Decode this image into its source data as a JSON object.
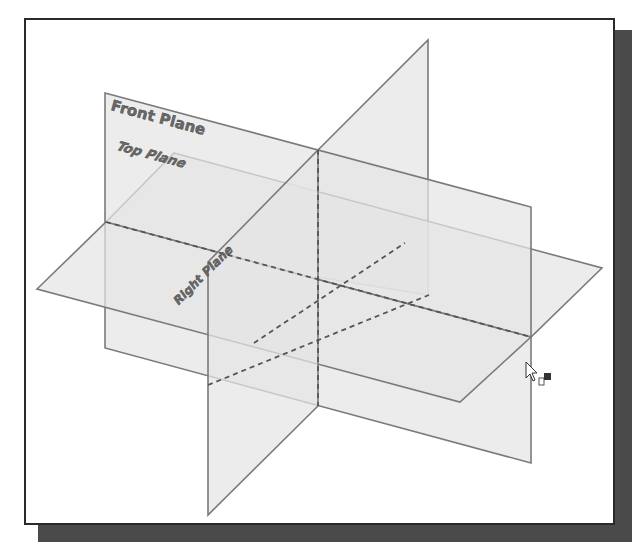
{
  "diagram": {
    "planes": [
      {
        "id": "front",
        "label": "Front Plane"
      },
      {
        "id": "top",
        "label": "Top Plane"
      },
      {
        "id": "right",
        "label": "Right Plane"
      }
    ],
    "cursor": {
      "icon": "arrow-cursor-with-plane-icon"
    },
    "colors": {
      "plane_fill": "#e4e4e4",
      "plane_edge": "#7a7a7a",
      "frame_border": "#2a2a2a",
      "frame_shadow": "#4a4a4a",
      "label_text": "#6a6a6a"
    }
  }
}
